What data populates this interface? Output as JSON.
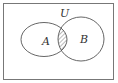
{
  "diagram": {
    "type": "venn",
    "universe": {
      "label": "U"
    },
    "sets": [
      {
        "label": "A"
      },
      {
        "label": "B"
      }
    ],
    "shaded_region": "A ∩ B",
    "colors": {
      "stroke": "#555555",
      "hatch": "#555555",
      "background": "#ffffff"
    }
  }
}
